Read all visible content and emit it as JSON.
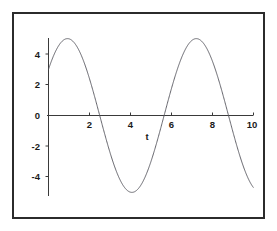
{
  "chart_data": {
    "type": "line",
    "title": "",
    "subtitle": "",
    "xlabel": "t",
    "ylabel": "",
    "xlim": [
      -0.25,
      10.3
    ],
    "ylim": [
      -5.6,
      5.6
    ],
    "grid": false,
    "legend": null,
    "xticks": [
      2,
      4,
      6,
      8,
      10
    ],
    "xtick_labels": [
      "2",
      "4",
      "6",
      "8",
      "10"
    ],
    "yticks": [
      4,
      2,
      0,
      -2,
      -4
    ],
    "ytick_labels": [
      "4",
      "2",
      "0",
      "-2",
      "-4"
    ],
    "series": [
      {
        "name": "5 sin(t + 0.6435)",
        "color": "#55555c",
        "amplitude": 5,
        "period": 6.2832,
        "y_at_x0": 3,
        "zero_crossings": [
          0.783,
          3.925,
          7.066
        ],
        "maxima": [
          {
            "x": 5.497,
            "y": 5
          }
        ],
        "minima": [
          {
            "x": 2.356,
            "y": -5
          },
          {
            "x": 8.639,
            "y": -5
          }
        ],
        "x": [
          0,
          0.25,
          0.5,
          0.75,
          1,
          1.25,
          1.5,
          1.75,
          2,
          2.25,
          2.5,
          2.75,
          3,
          3.25,
          3.5,
          3.75,
          4,
          4.25,
          4.5,
          4.75,
          5,
          5.25,
          5.5,
          5.75,
          6,
          6.25,
          6.5,
          6.75,
          7,
          7.25,
          7.5,
          7.75,
          8,
          8.25,
          8.5,
          8.75,
          9,
          9.25,
          9.5,
          9.75,
          10
        ],
        "y": [
          3,
          1.95,
          0.81,
          -0.36,
          -1.51,
          -2.6,
          -3.56,
          -4.35,
          -4.85,
          -4.99,
          -4.94,
          -4.55,
          -3.87,
          -2.95,
          -1.85,
          -0.64,
          0.6,
          1.8,
          2.9,
          3.83,
          4.54,
          4.93,
          5,
          4.79,
          4.2,
          3.35,
          2.28,
          1.09,
          -0.15,
          -1.36,
          -2.48,
          -3.43,
          -4.2,
          -4.74,
          -4.99,
          -4.95,
          -4.61,
          -3.98,
          -3.1,
          -2.03,
          -0.84
        ]
      }
    ],
    "xaxis_pixel_range": [
      46,
      251
    ],
    "yaxis_pixel_zero": 113
  }
}
